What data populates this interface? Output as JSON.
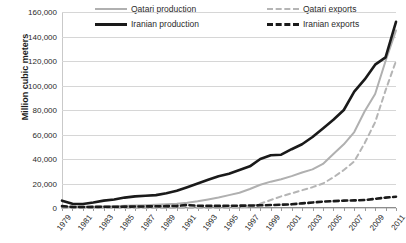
{
  "chart_data": {
    "type": "line",
    "title": "",
    "xlabel": "",
    "ylabel": "Million cubic meters",
    "ylim": [
      0,
      160000
    ],
    "yticks": [
      "0",
      "20,000",
      "40,000",
      "60,000",
      "80,000",
      "100,000",
      "120,000",
      "140,000",
      "160,000"
    ],
    "ytick_values": [
      0,
      20000,
      40000,
      60000,
      80000,
      100000,
      120000,
      140000,
      160000
    ],
    "grid": true,
    "legend_position": "top",
    "x": [
      1979,
      1980,
      1981,
      1982,
      1983,
      1984,
      1985,
      1986,
      1987,
      1988,
      1989,
      1990,
      1991,
      1992,
      1993,
      1994,
      1995,
      1996,
      1997,
      1998,
      1999,
      2000,
      2001,
      2002,
      2003,
      2004,
      2005,
      2006,
      2007,
      2008,
      2009,
      2010,
      2011
    ],
    "xtick_labels": [
      "1979",
      "1981",
      "1983",
      "1985",
      "1987",
      "1989",
      "1991",
      "1993",
      "1995",
      "1997",
      "1999",
      "2001",
      "2003",
      "2005",
      "2007",
      "2009",
      "2011"
    ],
    "xlim": [
      1979,
      2011
    ],
    "series": [
      {
        "name": "Qatari production",
        "color": "#b0b0b0",
        "style": "solid",
        "values": [
          800,
          900,
          1000,
          1100,
          1300,
          1500,
          1800,
          2000,
          2300,
          2600,
          3000,
          3500,
          4200,
          5500,
          7000,
          8500,
          10500,
          12500,
          15500,
          19000,
          21500,
          23500,
          26000,
          29000,
          31500,
          36000,
          44000,
          52000,
          62000,
          79000,
          93000,
          120000,
          145000
        ]
      },
      {
        "name": "Iranian production",
        "color": "#1a1a1a",
        "style": "solid",
        "values": [
          6000,
          3400,
          3300,
          4500,
          6000,
          7000,
          8500,
          9500,
          10000,
          10500,
          12000,
          14000,
          17000,
          20000,
          23000,
          26000,
          28000,
          31000,
          34000,
          40000,
          43000,
          43500,
          48000,
          52000,
          58000,
          65000,
          72000,
          80000,
          95000,
          105000,
          117000,
          123000,
          152000
        ]
      },
      {
        "name": "Qatari exports",
        "color": "#b5b5b5",
        "style": "dashed",
        "values": [
          0,
          0,
          0,
          0,
          0,
          0,
          0,
          0,
          0,
          0,
          0,
          0,
          0,
          0,
          0,
          0,
          0,
          300,
          1200,
          3500,
          6500,
          9500,
          12000,
          14500,
          17000,
          20000,
          25000,
          31000,
          38000,
          53000,
          70000,
          96000,
          120000
        ]
      },
      {
        "name": "Iranian exports",
        "color": "#1a1a1a",
        "style": "dashed",
        "values": [
          1500,
          900,
          800,
          900,
          1000,
          1000,
          1100,
          1200,
          1300,
          1400,
          1500,
          1700,
          2400,
          1800,
          1700,
          1700,
          1800,
          1900,
          2000,
          2200,
          2400,
          2700,
          3000,
          3800,
          4500,
          5200,
          5600,
          6000,
          6200,
          6500,
          7500,
          8500,
          9200
        ]
      }
    ]
  }
}
